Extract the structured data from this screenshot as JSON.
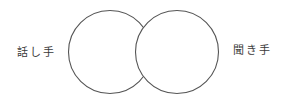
{
  "diagram": {
    "type": "overlapping-circles",
    "stroke_color": "#555555",
    "left_circle": {
      "label": "話し手",
      "cx": 110,
      "cy": 52,
      "r": 41.5
    },
    "right_circle": {
      "label": "聞き手",
      "cx": 177,
      "cy": 52,
      "r": 41.5
    }
  }
}
